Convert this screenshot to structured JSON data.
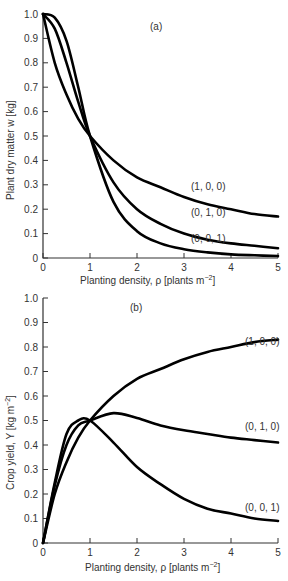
{
  "chart_data": [
    {
      "type": "line",
      "panel_label": "(a)",
      "title": "",
      "xlabel": "Planting density, ρ [plants m⁻²]",
      "ylabel": "Plant dry matter  w  [kg]",
      "xlim": [
        0,
        5
      ],
      "ylim": [
        0,
        1.0
      ],
      "x_ticks": [
        "0",
        "1",
        "2",
        "3",
        "4",
        "5"
      ],
      "y_ticks": [
        "0",
        "0.1",
        "0.2",
        "0.3",
        "0.4",
        "0.5",
        "0.6",
        "0.7",
        "0.8",
        "0.9",
        "1.0"
      ],
      "grid": false,
      "x": [
        0,
        0.25,
        0.5,
        0.75,
        1,
        1.5,
        2,
        2.5,
        3,
        3.5,
        4,
        4.5,
        5
      ],
      "series": [
        {
          "name": "(1, 0, 0)",
          "values": [
            1.0,
            0.8,
            0.67,
            0.57,
            0.5,
            0.4,
            0.33,
            0.29,
            0.25,
            0.22,
            0.2,
            0.18,
            0.17
          ]
        },
        {
          "name": "(0, 1, 0)",
          "values": [
            1.0,
            0.94,
            0.8,
            0.64,
            0.5,
            0.31,
            0.2,
            0.14,
            0.1,
            0.075,
            0.06,
            0.05,
            0.04
          ]
        },
        {
          "name": "(0, 0, 1)",
          "values": [
            1.0,
            0.985,
            0.89,
            0.7,
            0.5,
            0.23,
            0.11,
            0.06,
            0.036,
            0.023,
            0.015,
            0.011,
            0.008
          ]
        }
      ],
      "annotations": [
        "(1, 0, 0)",
        "(0, 1, 0)",
        "(0, 0, 1)"
      ]
    },
    {
      "type": "line",
      "panel_label": "(b)",
      "title": "",
      "xlabel": "Planting density, ρ [plants m⁻²]",
      "ylabel": "Crop yield, Y [kg m⁻²]",
      "xlim": [
        0,
        5
      ],
      "ylim": [
        0,
        1.0
      ],
      "x_ticks": [
        "0",
        "1",
        "2",
        "3",
        "4",
        "5"
      ],
      "y_ticks": [
        "0",
        "0.1",
        "0.2",
        "0.3",
        "0.4",
        "0.5",
        "0.6",
        "0.7",
        "0.8",
        "0.9",
        "1.0"
      ],
      "grid": false,
      "x": [
        0,
        0.25,
        0.5,
        0.75,
        1,
        1.5,
        2,
        2.5,
        3,
        3.5,
        4,
        4.5,
        5
      ],
      "series": [
        {
          "name": "(1, 0, 0)",
          "values": [
            0,
            0.2,
            0.33,
            0.43,
            0.5,
            0.6,
            0.67,
            0.71,
            0.75,
            0.78,
            0.8,
            0.82,
            0.83
          ]
        },
        {
          "name": "(0, 1, 0)",
          "values": [
            0,
            0.235,
            0.4,
            0.48,
            0.5,
            0.53,
            0.51,
            0.48,
            0.46,
            0.445,
            0.43,
            0.42,
            0.41
          ]
        },
        {
          "name": "(0, 0, 1)",
          "values": [
            0,
            0.246,
            0.445,
            0.5,
            0.5,
            0.41,
            0.31,
            0.24,
            0.18,
            0.14,
            0.12,
            0.1,
            0.09
          ]
        }
      ],
      "annotations": [
        "(1, 0, 0)",
        "(0, 1, 0)",
        "(0, 0, 1)"
      ]
    }
  ],
  "labels": {
    "panel_a": "(a)",
    "panel_b": "(b)",
    "xlabel_a": "Planting density, ρ [plants m",
    "xlabel_b": "Planting density, ρ [plants m",
    "xlabel_sup": "−2",
    "xlabel_end": "]",
    "ylabel_a": "Plant dry matter  w  [kg]",
    "ylabel_b_main": "Crop yield, Y [kg m",
    "ylabel_b_sup": "−2",
    "ylabel_b_end": "]",
    "series_a": [
      "(1, 0, 0)",
      "(0, 1, 0)",
      "(0, 0, 1)"
    ],
    "series_b": [
      "(1, 0, 0)",
      "(0, 1, 0)",
      "(0, 0, 1)"
    ],
    "xticks": [
      "0",
      "1",
      "2",
      "3",
      "4",
      "5"
    ],
    "yticks": [
      "0",
      "0.1",
      "0.2",
      "0.3",
      "0.4",
      "0.5",
      "0.6",
      "0.7",
      "0.8",
      "0.9",
      "1.0"
    ]
  }
}
